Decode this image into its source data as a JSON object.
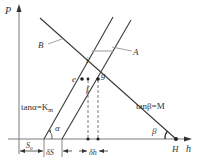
{
  "diagram": {
    "type": "geometric-construction",
    "axes": {
      "y_label": "P",
      "x_label": "h"
    },
    "lines": {
      "B": {
        "label": "B",
        "slope_label": "tanβ=M",
        "angle": "β"
      },
      "A": {
        "label": "A",
        "slope_label": "tanα=K",
        "slope_subscript": "m",
        "angle": "α"
      }
    },
    "points": {
      "i": "i",
      "e": "e",
      "f": "f",
      "g": "g",
      "H": "H"
    },
    "dimensions": {
      "s0": "S",
      "s0_sub": "0",
      "delta_s": "δS",
      "delta_h": "δh"
    },
    "colors": {
      "stroke": "#3a3a3a",
      "axis": "#7a7a7a",
      "leader": "#8a8a8a",
      "background": "#ffffff"
    }
  }
}
